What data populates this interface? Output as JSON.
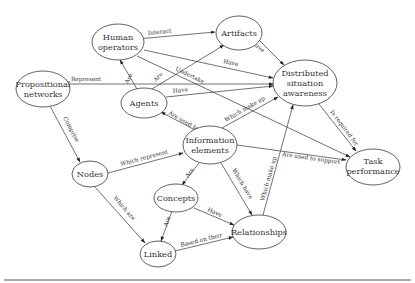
{
  "diagram": {
    "type": "concept-map",
    "nodes": [
      {
        "id": "human_operators",
        "lines": [
          "Human",
          "operators"
        ]
      },
      {
        "id": "artifacts",
        "lines": [
          "Artifacts"
        ]
      },
      {
        "id": "propositional_networks",
        "lines": [
          "Propositional",
          "networks"
        ]
      },
      {
        "id": "agents",
        "lines": [
          "Agents"
        ]
      },
      {
        "id": "dsa",
        "lines": [
          "Distributed",
          "situation",
          "awareness"
        ]
      },
      {
        "id": "information_elements",
        "lines": [
          "Information",
          "elements"
        ]
      },
      {
        "id": "nodes",
        "lines": [
          "Nodes"
        ]
      },
      {
        "id": "task_performance",
        "lines": [
          "Task",
          "performance"
        ]
      },
      {
        "id": "concepts",
        "lines": [
          "Concepts"
        ]
      },
      {
        "id": "linked",
        "lines": [
          "Linked"
        ]
      },
      {
        "id": "relationships",
        "lines": [
          "Relationships"
        ]
      }
    ],
    "edges": [
      {
        "from": "human_operators",
        "to": "artifacts",
        "label": "Interact",
        "bidirectional": true
      },
      {
        "from": "artifacts",
        "to": "dsa",
        "label": "Have"
      },
      {
        "from": "human_operators",
        "to": "dsa",
        "label": "Have"
      },
      {
        "from": "human_operators",
        "to": "task_performance",
        "label": "Undertake"
      },
      {
        "from": "agents",
        "to": "human_operators",
        "label": "Are"
      },
      {
        "from": "agents",
        "to": "artifacts",
        "label": "Are"
      },
      {
        "from": "agents",
        "to": "dsa",
        "label": "Have"
      },
      {
        "from": "propositional_networks",
        "to": "dsa",
        "label": "Represent"
      },
      {
        "from": "propositional_networks",
        "to": "nodes",
        "label": "Comprise"
      },
      {
        "from": "information_elements",
        "to": "agents",
        "label": "Are used by"
      },
      {
        "from": "information_elements",
        "to": "dsa",
        "label": "Which make up"
      },
      {
        "from": "information_elements",
        "to": "task_performance",
        "label": "Are used to support"
      },
      {
        "from": "dsa",
        "to": "task_performance",
        "label": "Is required for"
      },
      {
        "from": "nodes",
        "to": "information_elements",
        "label": "Which represent"
      },
      {
        "from": "nodes",
        "to": "linked",
        "label": "Which are"
      },
      {
        "from": "information_elements",
        "to": "concepts",
        "label": "Are"
      },
      {
        "from": "information_elements",
        "to": "relationships",
        "label": "Which have"
      },
      {
        "from": "concepts",
        "to": "relationships",
        "label": "Have"
      },
      {
        "from": "concepts",
        "to": "linked",
        "label": "Are"
      },
      {
        "from": "linked",
        "to": "relationships",
        "label": "Based on their"
      },
      {
        "from": "relationships",
        "to": "dsa",
        "label": "Which make up"
      }
    ]
  },
  "labels": {
    "human_operators": [
      "Human",
      "operators"
    ],
    "artifacts": "Artifacts",
    "propositional_networks": [
      "Propositional",
      "networks"
    ],
    "agents": "Agents",
    "dsa": [
      "Distributed",
      "situation",
      "awareness"
    ],
    "information_elements": [
      "Information",
      "elements"
    ],
    "nodes": "Nodes",
    "task_performance": [
      "Task",
      "performance"
    ],
    "concepts": "Concepts",
    "linked": "Linked",
    "relationships": "Relationships"
  },
  "edge_labels": {
    "interact": "Interact",
    "artifacts_have": "Have",
    "human_have": "Have",
    "undertake": "Undertake",
    "agents_are_human": "Are",
    "agents_are_artifacts": "Are",
    "agents_have": "Have",
    "represent": "Represent",
    "comprise": "Comprise",
    "are_used_by": "Are used by",
    "ie_which_make_up": "Which make up",
    "are_used_to_support": "Are used to support",
    "is_required_for": "Is required for",
    "which_represent": "Which represent",
    "which_are": "Which are",
    "ie_are": "Are",
    "which_have": "Which have",
    "concepts_have": "Have",
    "concepts_are": "Are",
    "based_on_their": "Based on their",
    "rel_which_make_up": "Which make up"
  }
}
